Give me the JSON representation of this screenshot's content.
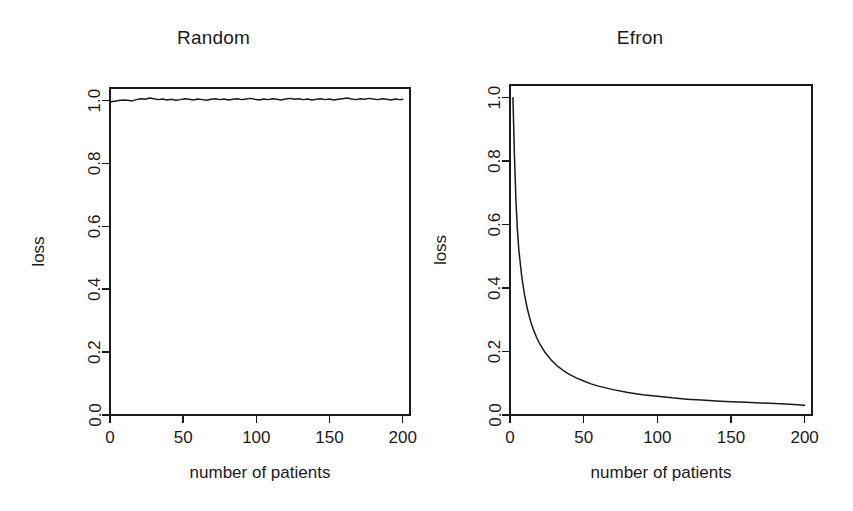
{
  "figure": {
    "background_color": "#ffffff",
    "ink_color": "#1a1a1a",
    "panel_count": 2
  },
  "chart_data": [
    {
      "type": "line",
      "title": "Random",
      "xlabel": "number of patients",
      "ylabel": "loss",
      "xlim": [
        0,
        205
      ],
      "ylim": [
        0.0,
        1.04
      ],
      "xticks": [
        0,
        50,
        100,
        150,
        200
      ],
      "xtick_labels": [
        "0",
        "50",
        "100",
        "150",
        "200"
      ],
      "yticks": [
        0.0,
        0.2,
        0.4,
        0.6,
        0.8,
        1.0
      ],
      "ytick_labels": [
        "0.0",
        "0.2",
        "0.4",
        "0.6",
        "0.8",
        "1.0"
      ],
      "grid": false,
      "legend": null,
      "series": [
        {
          "name": "Random allocation loss",
          "description": "Noisy flat trace hovering at loss = 1.0 across all patient counts",
          "x": [
            1,
            3,
            6,
            9,
            12,
            15,
            18,
            21,
            24,
            27,
            30,
            33,
            36,
            39,
            42,
            45,
            48,
            51,
            54,
            57,
            60,
            63,
            66,
            69,
            72,
            75,
            78,
            81,
            84,
            87,
            90,
            93,
            96,
            99,
            102,
            105,
            108,
            111,
            114,
            117,
            120,
            123,
            126,
            129,
            132,
            135,
            138,
            141,
            144,
            147,
            150,
            153,
            156,
            159,
            162,
            165,
            168,
            171,
            174,
            177,
            180,
            183,
            186,
            189,
            192,
            195,
            198,
            200
          ],
          "y": [
            0.996,
            0.998,
            1.0,
            1.002,
            1.001,
            0.999,
            1.003,
            1.006,
            1.004,
            1.008,
            1.006,
            1.003,
            1.005,
            1.002,
            1.004,
            1.001,
            1.003,
            1.006,
            1.004,
            1.002,
            1.005,
            1.003,
            1.001,
            1.004,
            1.006,
            1.003,
            1.005,
            1.002,
            1.004,
            1.006,
            1.003,
            1.005,
            1.007,
            1.004,
            1.002,
            1.005,
            1.003,
            1.006,
            1.004,
            1.002,
            1.005,
            1.007,
            1.004,
            1.006,
            1.003,
            1.005,
            1.002,
            1.004,
            1.006,
            1.003,
            1.005,
            1.002,
            1.004,
            1.006,
            1.008,
            1.005,
            1.003,
            1.006,
            1.004,
            1.007,
            1.005,
            1.003,
            1.006,
            1.004,
            1.002,
            1.005,
            1.003,
            1.004
          ]
        }
      ]
    },
    {
      "type": "line",
      "title": "Efron",
      "xlabel": "number of patients",
      "ylabel": "loss",
      "xlim": [
        0,
        205
      ],
      "ylim": [
        0.0,
        1.04
      ],
      "xticks": [
        0,
        50,
        100,
        150,
        200
      ],
      "xtick_labels": [
        "0",
        "50",
        "100",
        "150",
        "200"
      ],
      "yticks": [
        0.0,
        0.2,
        0.4,
        0.6,
        0.8,
        1.0
      ],
      "ytick_labels": [
        "0.0",
        "0.2",
        "0.4",
        "0.6",
        "0.8",
        "1.0"
      ],
      "grid": false,
      "legend": null,
      "series": [
        {
          "name": "Efron biased coin loss",
          "description": "Steep monotone decay from loss = 1.0 at the smallest patient count toward an asymptote near 0.03",
          "x": [
            2,
            3,
            4,
            5,
            6,
            8,
            10,
            12,
            14,
            16,
            18,
            20,
            24,
            28,
            32,
            36,
            40,
            45,
            50,
            55,
            60,
            70,
            80,
            90,
            100,
            110,
            120,
            130,
            140,
            150,
            160,
            170,
            180,
            190,
            200
          ],
          "y": [
            1.0,
            0.82,
            0.68,
            0.585,
            0.52,
            0.435,
            0.375,
            0.33,
            0.295,
            0.268,
            0.245,
            0.226,
            0.196,
            0.173,
            0.155,
            0.141,
            0.129,
            0.117,
            0.107,
            0.098,
            0.091,
            0.08,
            0.071,
            0.064,
            0.059,
            0.054,
            0.05,
            0.047,
            0.044,
            0.042,
            0.04,
            0.038,
            0.036,
            0.034,
            0.031
          ]
        }
      ]
    }
  ]
}
